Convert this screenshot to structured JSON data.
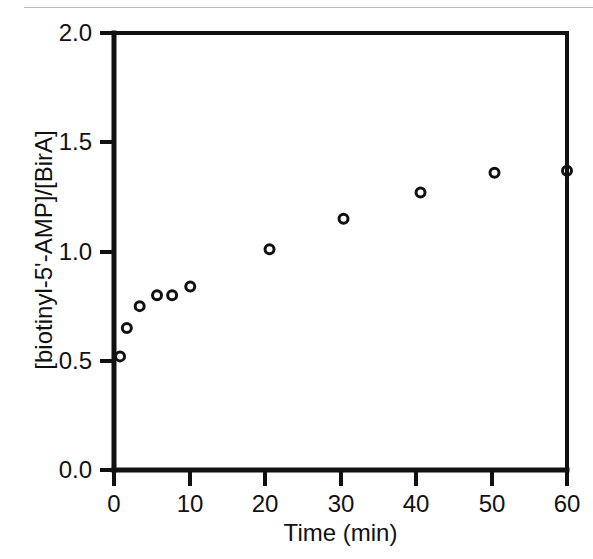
{
  "figure": {
    "background_color": "#ffffff",
    "ink_color": "#111111",
    "artifact_line": "scan-line"
  },
  "chart_data": {
    "type": "scatter",
    "title": "",
    "xlabel": "Time (min)",
    "ylabel": "[biotinyl-5'-AMP]/[BirA]",
    "xlim": [
      0,
      60
    ],
    "ylim": [
      0.0,
      2.0
    ],
    "xticks": [
      0,
      10,
      20,
      30,
      40,
      50,
      60
    ],
    "xtick_labels": [
      "0",
      "10",
      "20",
      "30",
      "40",
      "50",
      "60"
    ],
    "yticks": [
      0.0,
      0.5,
      1.0,
      1.5,
      2.0
    ],
    "ytick_labels": [
      "0.0",
      "0.5",
      "1.0",
      "1.5",
      "2.0"
    ],
    "grid": false,
    "legend": false,
    "marker": "open-circle",
    "marker_size": 9,
    "series": [
      {
        "name": "biotinyl-5'-AMP per BirA",
        "x": [
          0.8,
          1.7,
          3.4,
          5.7,
          7.7,
          10.1,
          20.6,
          30.4,
          40.6,
          50.4,
          60.0
        ],
        "y": [
          0.52,
          0.65,
          0.75,
          0.8,
          0.8,
          0.84,
          1.01,
          1.15,
          1.27,
          1.36,
          1.37
        ]
      }
    ]
  }
}
